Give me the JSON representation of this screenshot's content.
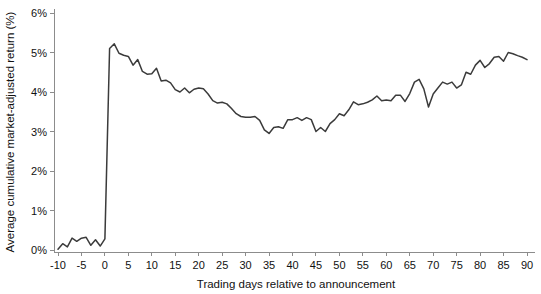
{
  "chart_data": {
    "type": "line",
    "title": "",
    "xlabel": "Trading days relative to announcement",
    "ylabel": "Average cumulative market-adjusted return (%)",
    "xlim": [
      -10,
      90
    ],
    "ylim": [
      0,
      6
    ],
    "xticks": [
      -10,
      -5,
      0,
      5,
      10,
      15,
      20,
      25,
      30,
      35,
      40,
      45,
      50,
      55,
      60,
      65,
      70,
      75,
      80,
      85,
      90
    ],
    "xtick_labels": [
      "-10",
      "-5",
      "0",
      "5",
      "10",
      "15",
      "20",
      "25",
      "30",
      "35",
      "40",
      "45",
      "50",
      "55",
      "60",
      "65",
      "70",
      "75",
      "80",
      "85",
      "90"
    ],
    "yticks": [
      0,
      1,
      2,
      3,
      4,
      5,
      6
    ],
    "ytick_labels": [
      "0%",
      "1%",
      "2%",
      "3%",
      "4%",
      "5%",
      "6%"
    ],
    "grid": false,
    "legend": null,
    "line_color": "#3b3b3b",
    "axis_color": "#8c8c8c",
    "series": [
      {
        "name": "Average cumulative market-adjusted return",
        "x": [
          -10,
          -9,
          -8,
          -7,
          -6,
          -5,
          -4,
          -3,
          -2,
          -1,
          0,
          1,
          2,
          3,
          4,
          5,
          6,
          7,
          8,
          9,
          10,
          11,
          12,
          13,
          14,
          15,
          16,
          17,
          18,
          19,
          20,
          21,
          22,
          23,
          24,
          25,
          26,
          27,
          28,
          29,
          30,
          31,
          32,
          33,
          34,
          35,
          36,
          37,
          38,
          39,
          40,
          41,
          42,
          43,
          44,
          45,
          46,
          47,
          48,
          49,
          50,
          51,
          52,
          53,
          54,
          55,
          56,
          57,
          58,
          59,
          60,
          61,
          62,
          63,
          64,
          65,
          66,
          67,
          68,
          69,
          70,
          71,
          72,
          73,
          74,
          75,
          76,
          77,
          78,
          79,
          80,
          81,
          82,
          83,
          84,
          85,
          86,
          87,
          88,
          89,
          90
        ],
        "values": [
          0.02,
          0.16,
          0.08,
          0.3,
          0.22,
          0.3,
          0.32,
          0.12,
          0.26,
          0.1,
          0.28,
          5.1,
          5.22,
          4.98,
          4.93,
          4.9,
          4.68,
          4.82,
          4.52,
          4.45,
          4.46,
          4.6,
          4.28,
          4.3,
          4.23,
          4.06,
          4.0,
          4.1,
          3.98,
          4.07,
          4.1,
          4.08,
          3.95,
          3.78,
          3.72,
          3.74,
          3.7,
          3.58,
          3.45,
          3.38,
          3.36,
          3.36,
          3.38,
          3.28,
          3.04,
          2.95,
          3.1,
          3.12,
          3.08,
          3.3,
          3.3,
          3.35,
          3.28,
          3.35,
          3.3,
          3.0,
          3.1,
          3.0,
          3.2,
          3.3,
          3.45,
          3.4,
          3.55,
          3.75,
          3.68,
          3.7,
          3.74,
          3.8,
          3.9,
          3.78,
          3.8,
          3.78,
          3.92,
          3.92,
          3.76,
          3.96,
          4.25,
          4.32,
          4.08,
          3.62,
          3.95,
          4.1,
          4.25,
          4.2,
          4.25,
          4.1,
          4.18,
          4.5,
          4.45,
          4.68,
          4.8,
          4.62,
          4.72,
          4.88,
          4.9,
          4.78,
          5.0,
          4.97,
          4.92,
          4.88,
          4.82
        ]
      }
    ]
  }
}
